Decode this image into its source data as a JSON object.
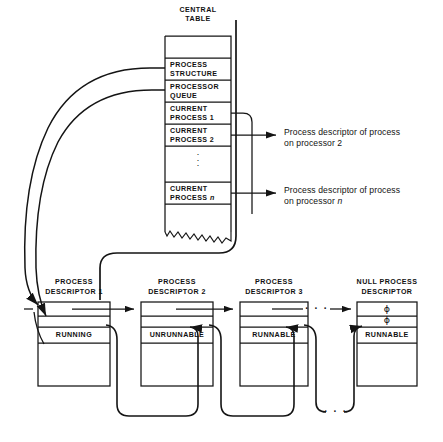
{
  "diagram": {
    "central_table": {
      "caption_line1": "CENTRAL",
      "caption_line2": "TABLE",
      "rows": [
        {
          "id": "blank-top",
          "label": "",
          "kind": "blank"
        },
        {
          "id": "process-structure",
          "label": "PROCESS\nSTRUCTURE",
          "kind": "entry"
        },
        {
          "id": "processor-queue",
          "label": "PROCESSOR\nQUEUE",
          "kind": "entry"
        },
        {
          "id": "current-process-1",
          "label": "CURRENT\nPROCESS 1",
          "kind": "entry"
        },
        {
          "id": "current-process-2",
          "label": "CURRENT\nPROCESS 2",
          "kind": "entry"
        },
        {
          "id": "ellipsis",
          "label": "⋮",
          "kind": "ellipsis"
        },
        {
          "id": "current-process-n",
          "label": "CURRENT\nPROCESS n",
          "kind": "entry",
          "italic_tail": "n"
        },
        {
          "id": "blank-bottom",
          "label": "",
          "kind": "torn"
        }
      ]
    },
    "annotations": [
      {
        "id": "annotation-processor-2",
        "line1": "Process descriptor of process",
        "line2": "on processor 2",
        "source_row": "current-process-2"
      },
      {
        "id": "annotation-processor-n",
        "line1": "Process descriptor of process",
        "line2": "on processor n",
        "source_row": "current-process-n"
      }
    ],
    "descriptors": [
      {
        "id": "process-descriptor-1",
        "caption_line1": "PROCESS",
        "caption_line2": "DESCRIPTOR 1",
        "field_top": "",
        "field_second": "",
        "status": "RUNNING",
        "field_body": ""
      },
      {
        "id": "process-descriptor-2",
        "caption_line1": "PROCESS",
        "caption_line2": "DESCRIPTOR 2",
        "field_top": "",
        "field_second": "",
        "status": "UNRUNNABLE",
        "field_body": ""
      },
      {
        "id": "process-descriptor-3",
        "caption_line1": "PROCESS",
        "caption_line2": "DESCRIPTOR 3",
        "field_top": "",
        "field_second": "",
        "status": "RUNNABLE",
        "field_body": ""
      },
      {
        "id": "null-process-descriptor",
        "caption_line1": "NULL PROCESS",
        "caption_line2": "DESCRIPTOR",
        "field_top": "ϕ",
        "field_second": "ϕ",
        "status": "RUNNABLE",
        "field_body": ""
      }
    ],
    "ellipsis_chain_top": "· · ·",
    "ellipsis_chain_bottom": "· · ·",
    "colors": {
      "ink": "#111111",
      "line": "#1a1a1a",
      "background": "#ffffff"
    }
  }
}
